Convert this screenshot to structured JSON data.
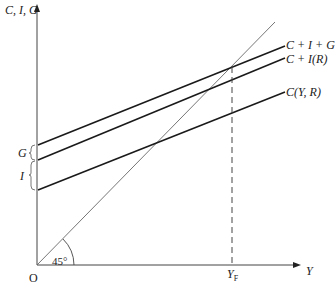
{
  "axes": {
    "y_label": "C, I, G",
    "x_label": "Y",
    "origin_label": "O"
  },
  "angle_label": "45°",
  "left_labels": {
    "G": "G",
    "I": "I"
  },
  "curves": [
    {
      "name": "aggregate-demand",
      "label": "C + I + G"
    },
    {
      "name": "consumption-investment",
      "label": "C + I(R)"
    },
    {
      "name": "consumption",
      "label": "C(Y, R)"
    }
  ],
  "full_employment": {
    "label": "Y",
    "subscript": "F"
  },
  "reference_line": "45-degree line",
  "colors": {
    "line": "#1a1a1a",
    "axis": "#333333",
    "thin": "#555555"
  }
}
